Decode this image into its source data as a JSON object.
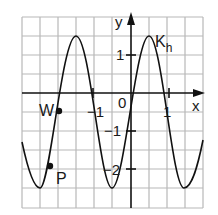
{
  "figure": {
    "axis_labels": {
      "x": "x",
      "y": "y"
    },
    "origin_label": "0",
    "tick_labels": {
      "x_pos": "1",
      "x_neg": "−1",
      "y_pos": "1",
      "y_neg1": "−1",
      "y_neg2": "−2"
    },
    "curve_label": "K",
    "curve_label_sub": "h",
    "points": [
      {
        "name": "W",
        "label": "W"
      },
      {
        "name": "P",
        "label": "P"
      }
    ],
    "colors": {
      "grid": "#b8b8b8",
      "axis": "#111111",
      "curve": "#111111"
    }
  }
}
